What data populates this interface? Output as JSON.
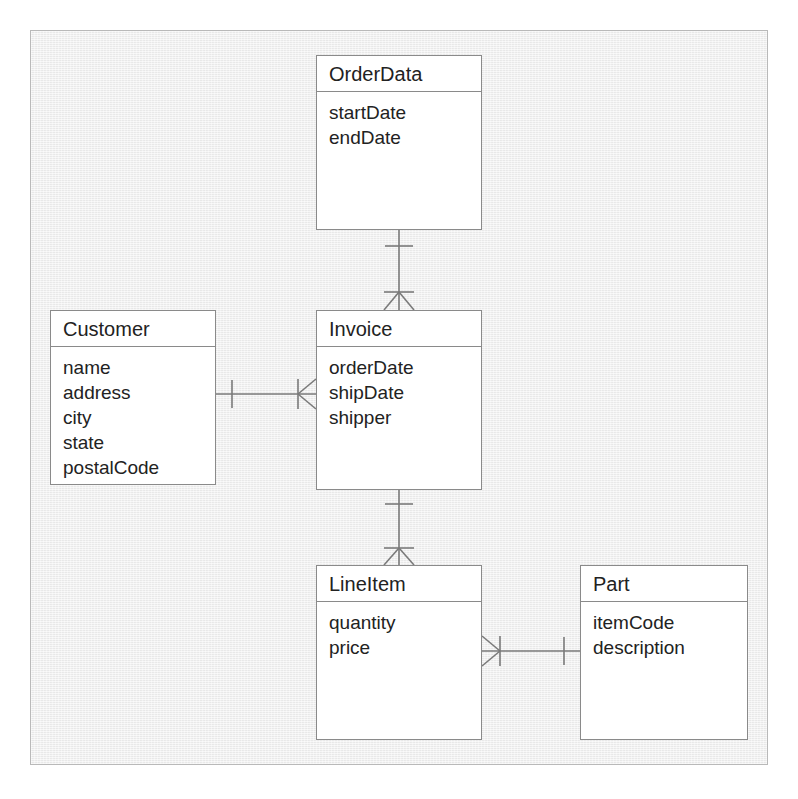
{
  "diagram": {
    "kind": "entity-relationship-class-diagram",
    "notation": "crows-foot",
    "background_color": "#eeeeee",
    "frame_color": "#b9b9b9",
    "box_fill": "#ffffff",
    "box_border": "#8a8a8a",
    "line_color": "#7a7a7a",
    "text_color": "#222222",
    "entities": [
      {
        "id": "orderdata",
        "title": "OrderData",
        "attributes": [
          "startDate",
          "endDate"
        ],
        "x": 316,
        "y": 55,
        "w": 166,
        "h": 175
      },
      {
        "id": "customer",
        "title": "Customer",
        "attributes": [
          "name",
          "address",
          "city",
          "state",
          "postalCode"
        ],
        "x": 50,
        "y": 310,
        "w": 166,
        "h": 175
      },
      {
        "id": "invoice",
        "title": "Invoice",
        "attributes": [
          "orderDate",
          "shipDate",
          "shipper"
        ],
        "x": 316,
        "y": 310,
        "w": 166,
        "h": 180
      },
      {
        "id": "lineitem",
        "title": "LineItem",
        "attributes": [
          "quantity",
          "price"
        ],
        "x": 316,
        "y": 565,
        "w": 166,
        "h": 175
      },
      {
        "id": "part",
        "title": "Part",
        "attributes": [
          "itemCode",
          "description"
        ],
        "x": 580,
        "y": 565,
        "w": 168,
        "h": 175
      }
    ],
    "relationships": [
      {
        "id": "orderdata-invoice",
        "from": "orderdata",
        "to": "invoice",
        "orientation": "vertical",
        "from_marker": "one",
        "to_marker": "many"
      },
      {
        "id": "customer-invoice",
        "from": "customer",
        "to": "invoice",
        "orientation": "horizontal",
        "from_marker": "one",
        "to_marker": "many"
      },
      {
        "id": "invoice-lineitem",
        "from": "invoice",
        "to": "lineitem",
        "orientation": "vertical",
        "from_marker": "one",
        "to_marker": "many"
      },
      {
        "id": "lineitem-part",
        "from": "lineitem",
        "to": "part",
        "orientation": "horizontal",
        "from_marker": "many",
        "to_marker": "one"
      }
    ]
  }
}
